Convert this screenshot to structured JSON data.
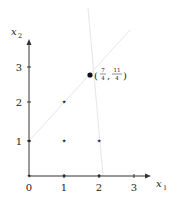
{
  "diagram": {
    "type": "integer-lattice-plot",
    "axes": {
      "x_label": "x",
      "x_label_sub": "1",
      "y_label": "x",
      "y_label_sub": "2",
      "x_ticks": [
        "0",
        "1",
        "2",
        "3"
      ],
      "y_ticks": [
        "1",
        "2",
        "3"
      ]
    },
    "lattice_points": [
      {
        "x": 1,
        "y": 1,
        "marker": "star"
      },
      {
        "x": 2,
        "y": 1,
        "marker": "star"
      },
      {
        "x": 1,
        "y": 2,
        "marker": "star"
      }
    ],
    "highlighted_point": {
      "x": 1.75,
      "y": 2.75,
      "marker": "filled-circle",
      "label_open": "(",
      "label_close": ")",
      "label_sep": ",",
      "label_x_num": "7",
      "label_x_den": "4",
      "label_y_num": "11",
      "label_y_den": "4"
    },
    "constraint_lines": [
      {
        "name": "line-1",
        "color": "#e6e6e6"
      },
      {
        "name": "line-2",
        "color": "#e6e6e6"
      }
    ],
    "colors": {
      "axis": "#333333",
      "marker": "#444444",
      "constraint": "#e4e4e4"
    }
  }
}
